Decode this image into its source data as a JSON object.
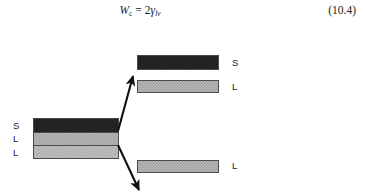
{
  "equation": {
    "lhs_symbol": "W",
    "lhs_subscript": "c",
    "operator": "=",
    "coefficient": "2",
    "rhs_symbol": "γ",
    "rhs_subscript": "lv",
    "number": "(10.4)"
  },
  "figure": {
    "left_stack": {
      "name": "initial-solid-liquid-liquid-stack",
      "bands": [
        {
          "label": "S",
          "phase": "solid",
          "fill": "dark-dither"
        },
        {
          "label": "L",
          "phase": "liquid",
          "fill": "light-dither"
        },
        {
          "label": "L",
          "phase": "liquid",
          "fill": "light-dither"
        }
      ]
    },
    "separated_bars": [
      {
        "label": "S",
        "phase": "solid",
        "fill": "dark-dither",
        "position": "upper"
      },
      {
        "label": "L",
        "phase": "liquid",
        "fill": "light-dither",
        "position": "upper"
      },
      {
        "label": "L",
        "phase": "liquid",
        "fill": "light-dither",
        "position": "lower"
      }
    ],
    "arrows": [
      {
        "name": "separation-arrow-up",
        "direction": "up-right"
      },
      {
        "name": "separation-arrow-down",
        "direction": "down-right"
      }
    ]
  },
  "colors": {
    "ink": "#1b1b1b",
    "outline": "#4a4a4a",
    "solid_fill": "#2e2e2e",
    "liquid_fill": "#b7b7b7",
    "background": "#ffffff"
  }
}
